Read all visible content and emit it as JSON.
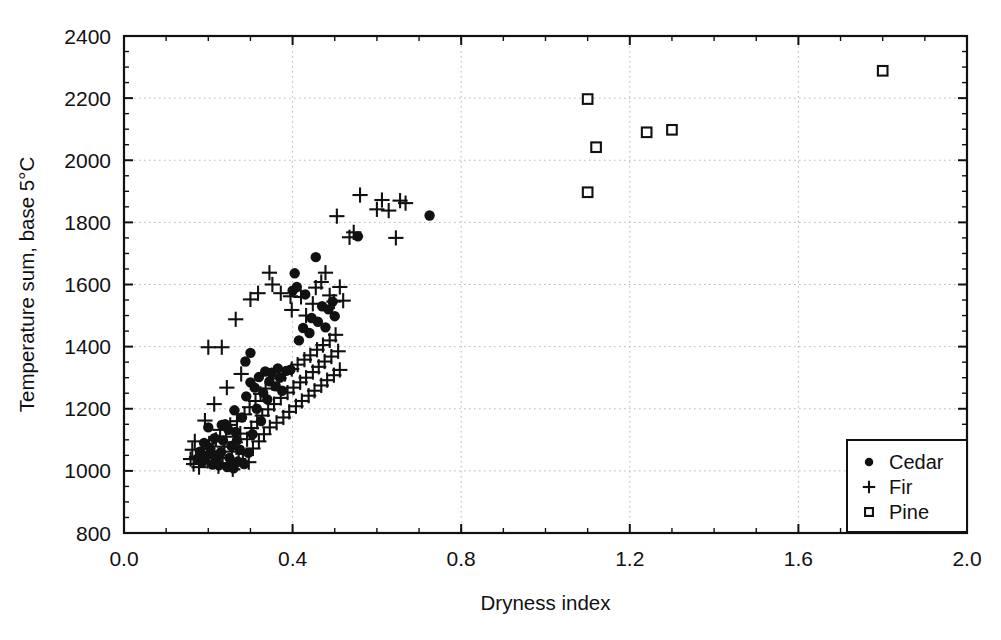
{
  "chart_data": {
    "type": "scatter",
    "title": "",
    "xlabel": "Dryness index",
    "ylabel": "Temperature sum, base 5°C",
    "xlim": [
      0.0,
      2.0
    ],
    "ylim": [
      800,
      2400
    ],
    "xticks": [
      "0.0",
      "0.4",
      "0.8",
      "1.2",
      "1.6",
      "2.0"
    ],
    "xtick_values": [
      0.0,
      0.4,
      0.8,
      1.2,
      1.6,
      2.0
    ],
    "yticks": [
      "800",
      "1000",
      "1200",
      "1400",
      "1600",
      "1800",
      "2000",
      "2200",
      "2400"
    ],
    "ytick_values": [
      800,
      1000,
      1200,
      1400,
      1600,
      1800,
      2000,
      2200,
      2400
    ],
    "x_minor_step": 0.1,
    "y_minor_step": 50,
    "grid": true,
    "grid_style": "dotted-horizontal-and-vertical",
    "legend_position": "bottom-right",
    "series": [
      {
        "name": "Cedar",
        "marker": "filled-circle",
        "color": "#111111",
        "points": [
          [
            0.175,
            1040
          ],
          [
            0.18,
            1062
          ],
          [
            0.185,
            1028
          ],
          [
            0.19,
            1090
          ],
          [
            0.195,
            1048
          ],
          [
            0.2,
            1140
          ],
          [
            0.205,
            1072
          ],
          [
            0.21,
            1020
          ],
          [
            0.215,
            1105
          ],
          [
            0.22,
            1035
          ],
          [
            0.225,
            1018
          ],
          [
            0.23,
            1060
          ],
          [
            0.235,
            1098
          ],
          [
            0.24,
            1150
          ],
          [
            0.245,
            1012
          ],
          [
            0.25,
            1042
          ],
          [
            0.255,
            1080
          ],
          [
            0.26,
            1008
          ],
          [
            0.262,
            1195
          ],
          [
            0.265,
            1125
          ],
          [
            0.27,
            1030
          ],
          [
            0.275,
            1068
          ],
          [
            0.28,
            1172
          ],
          [
            0.285,
            1022
          ],
          [
            0.29,
            1240
          ],
          [
            0.295,
            1058
          ],
          [
            0.3,
            1285
          ],
          [
            0.305,
            1118
          ],
          [
            0.31,
            1268
          ],
          [
            0.315,
            1200
          ],
          [
            0.32,
            1302
          ],
          [
            0.325,
            1160
          ],
          [
            0.33,
            1252
          ],
          [
            0.335,
            1320
          ],
          [
            0.34,
            1230
          ],
          [
            0.345,
            1288
          ],
          [
            0.35,
            1316
          ],
          [
            0.36,
            1272
          ],
          [
            0.365,
            1330
          ],
          [
            0.37,
            1300
          ],
          [
            0.375,
            1258
          ],
          [
            0.385,
            1322
          ],
          [
            0.395,
            1326
          ],
          [
            0.4,
            1580
          ],
          [
            0.405,
            1636
          ],
          [
            0.41,
            1592
          ],
          [
            0.415,
            1420
          ],
          [
            0.425,
            1460
          ],
          [
            0.43,
            1568
          ],
          [
            0.44,
            1444
          ],
          [
            0.445,
            1492
          ],
          [
            0.455,
            1688
          ],
          [
            0.46,
            1480
          ],
          [
            0.47,
            1530
          ],
          [
            0.478,
            1462
          ],
          [
            0.485,
            1520
          ],
          [
            0.495,
            1545
          ],
          [
            0.5,
            1498
          ],
          [
            0.3,
            1380
          ],
          [
            0.288,
            1352
          ],
          [
            0.268,
            1098
          ],
          [
            0.248,
            1132
          ],
          [
            0.232,
            1148
          ],
          [
            0.212,
            1052
          ],
          [
            0.555,
            1755
          ],
          [
            0.725,
            1822
          ]
        ]
      },
      {
        "name": "Fir",
        "marker": "plus",
        "color": "#111111",
        "points": [
          [
            0.165,
            1022
          ],
          [
            0.172,
            1045
          ],
          [
            0.178,
            1012
          ],
          [
            0.188,
            1070
          ],
          [
            0.198,
            1032
          ],
          [
            0.202,
            1088
          ],
          [
            0.208,
            1058
          ],
          [
            0.218,
            1100
          ],
          [
            0.224,
            1015
          ],
          [
            0.228,
            1132
          ],
          [
            0.234,
            1042
          ],
          [
            0.238,
            1078
          ],
          [
            0.242,
            1110
          ],
          [
            0.246,
            1025
          ],
          [
            0.252,
            1148
          ],
          [
            0.256,
            1062
          ],
          [
            0.258,
            1005
          ],
          [
            0.264,
            1092
          ],
          [
            0.268,
            1160
          ],
          [
            0.272,
            1038
          ],
          [
            0.276,
            1120
          ],
          [
            0.282,
            1055
          ],
          [
            0.286,
            1182
          ],
          [
            0.292,
            1102
          ],
          [
            0.296,
            1028
          ],
          [
            0.298,
            1205
          ],
          [
            0.302,
            1138
          ],
          [
            0.306,
            1072
          ],
          [
            0.312,
            1225
          ],
          [
            0.316,
            1158
          ],
          [
            0.32,
            1095
          ],
          [
            0.324,
            1248
          ],
          [
            0.328,
            1178
          ],
          [
            0.332,
            1118
          ],
          [
            0.336,
            1265
          ],
          [
            0.342,
            1198
          ],
          [
            0.346,
            1140
          ],
          [
            0.352,
            1282
          ],
          [
            0.356,
            1215
          ],
          [
            0.362,
            1155
          ],
          [
            0.368,
            1298
          ],
          [
            0.372,
            1235
          ],
          [
            0.378,
            1172
          ],
          [
            0.382,
            1312
          ],
          [
            0.388,
            1252
          ],
          [
            0.392,
            1190
          ],
          [
            0.398,
            1328
          ],
          [
            0.402,
            1268
          ],
          [
            0.408,
            1208
          ],
          [
            0.412,
            1342
          ],
          [
            0.418,
            1285
          ],
          [
            0.422,
            1225
          ],
          [
            0.428,
            1358
          ],
          [
            0.432,
            1300
          ],
          [
            0.438,
            1242
          ],
          [
            0.442,
            1372
          ],
          [
            0.448,
            1318
          ],
          [
            0.452,
            1258
          ],
          [
            0.458,
            1390
          ],
          [
            0.462,
            1335
          ],
          [
            0.468,
            1275
          ],
          [
            0.472,
            1405
          ],
          [
            0.476,
            1352
          ],
          [
            0.482,
            1292
          ],
          [
            0.488,
            1420
          ],
          [
            0.492,
            1368
          ],
          [
            0.498,
            1308
          ],
          [
            0.502,
            1438
          ],
          [
            0.508,
            1385
          ],
          [
            0.512,
            1325
          ],
          [
            0.2,
            1398
          ],
          [
            0.232,
            1398
          ],
          [
            0.265,
            1488
          ],
          [
            0.3,
            1552
          ],
          [
            0.318,
            1572
          ],
          [
            0.345,
            1638
          ],
          [
            0.352,
            1600
          ],
          [
            0.372,
            1572
          ],
          [
            0.395,
            1562
          ],
          [
            0.398,
            1518
          ],
          [
            0.42,
            1560
          ],
          [
            0.432,
            1500
          ],
          [
            0.448,
            1538
          ],
          [
            0.455,
            1590
          ],
          [
            0.468,
            1608
          ],
          [
            0.478,
            1638
          ],
          [
            0.488,
            1565
          ],
          [
            0.498,
            1545
          ],
          [
            0.505,
            1820
          ],
          [
            0.512,
            1592
          ],
          [
            0.52,
            1548
          ],
          [
            0.535,
            1752
          ],
          [
            0.545,
            1768
          ],
          [
            0.56,
            1888
          ],
          [
            0.6,
            1842
          ],
          [
            0.612,
            1872
          ],
          [
            0.628,
            1838
          ],
          [
            0.645,
            1750
          ],
          [
            0.655,
            1870
          ],
          [
            0.668,
            1862
          ],
          [
            0.158,
            1038
          ],
          [
            0.162,
            1068
          ],
          [
            0.168,
            1095
          ],
          [
            0.192,
            1162
          ],
          [
            0.214,
            1215
          ],
          [
            0.244,
            1268
          ],
          [
            0.278,
            1312
          ]
        ]
      },
      {
        "name": "Pine",
        "marker": "open-square",
        "color": "#111111",
        "points": [
          [
            1.1,
            2197
          ],
          [
            1.1,
            1897
          ],
          [
            1.12,
            2042
          ],
          [
            1.24,
            2090
          ],
          [
            1.3,
            2098
          ],
          [
            1.8,
            2288
          ]
        ]
      }
    ]
  },
  "legend": {
    "entries": [
      {
        "label": "Cedar",
        "marker": "filled-circle"
      },
      {
        "label": "Fir",
        "marker": "plus"
      },
      {
        "label": "Pine",
        "marker": "open-square"
      }
    ]
  }
}
